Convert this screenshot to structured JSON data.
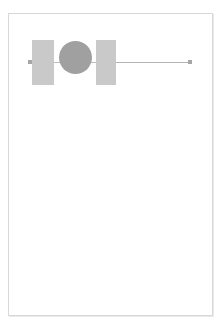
{
  "canvas": {
    "width": 223,
    "height": 333,
    "background_color": "#ffffff",
    "page": {
      "label": "page-sheet",
      "x": 8,
      "y": 13,
      "width": 205,
      "height": 303,
      "fill_color": "#ffffff",
      "border_color": "#d8d8d8"
    }
  },
  "diagram": {
    "title": "",
    "shape_count": 4,
    "handle_count": 2,
    "shapes": [
      {
        "id": "rect-1",
        "type": "rectangle",
        "label": "",
        "x": 32,
        "y": 40,
        "width": 22,
        "height": 45,
        "fill_color": "#c9c9c9"
      },
      {
        "id": "circle-1",
        "type": "circle",
        "label": "",
        "x": 59,
        "y": 41,
        "width": 33,
        "height": 33,
        "fill_color": "#a0a0a0"
      },
      {
        "id": "rect-2",
        "type": "rectangle",
        "label": "",
        "x": 96,
        "y": 40,
        "width": 20,
        "height": 45,
        "fill_color": "#c9c9c9"
      },
      {
        "id": "line-1",
        "type": "line",
        "label": "",
        "x": 116,
        "y": 62,
        "width": 74,
        "height": 1,
        "stroke_color": "#b4b4b4"
      }
    ],
    "connectors": [
      {
        "id": "stub-left",
        "type": "connector",
        "x": 28,
        "y": 62,
        "width": 5,
        "stroke_color": "#bdbdbd"
      },
      {
        "id": "stub-mid",
        "type": "connector",
        "x": 53,
        "y": 62,
        "width": 7,
        "stroke_color": "#bdbdbd"
      },
      {
        "id": "stub-right",
        "type": "connector",
        "x": 90,
        "y": 62,
        "width": 7,
        "stroke_color": "#bdbdbd"
      }
    ],
    "handles": [
      {
        "id": "handle-start",
        "position": "start",
        "x": 28,
        "y": 60,
        "color": "#a6a6a6"
      },
      {
        "id": "handle-end",
        "position": "end",
        "x": 188,
        "y": 60,
        "color": "#a6a6a6"
      }
    ]
  }
}
